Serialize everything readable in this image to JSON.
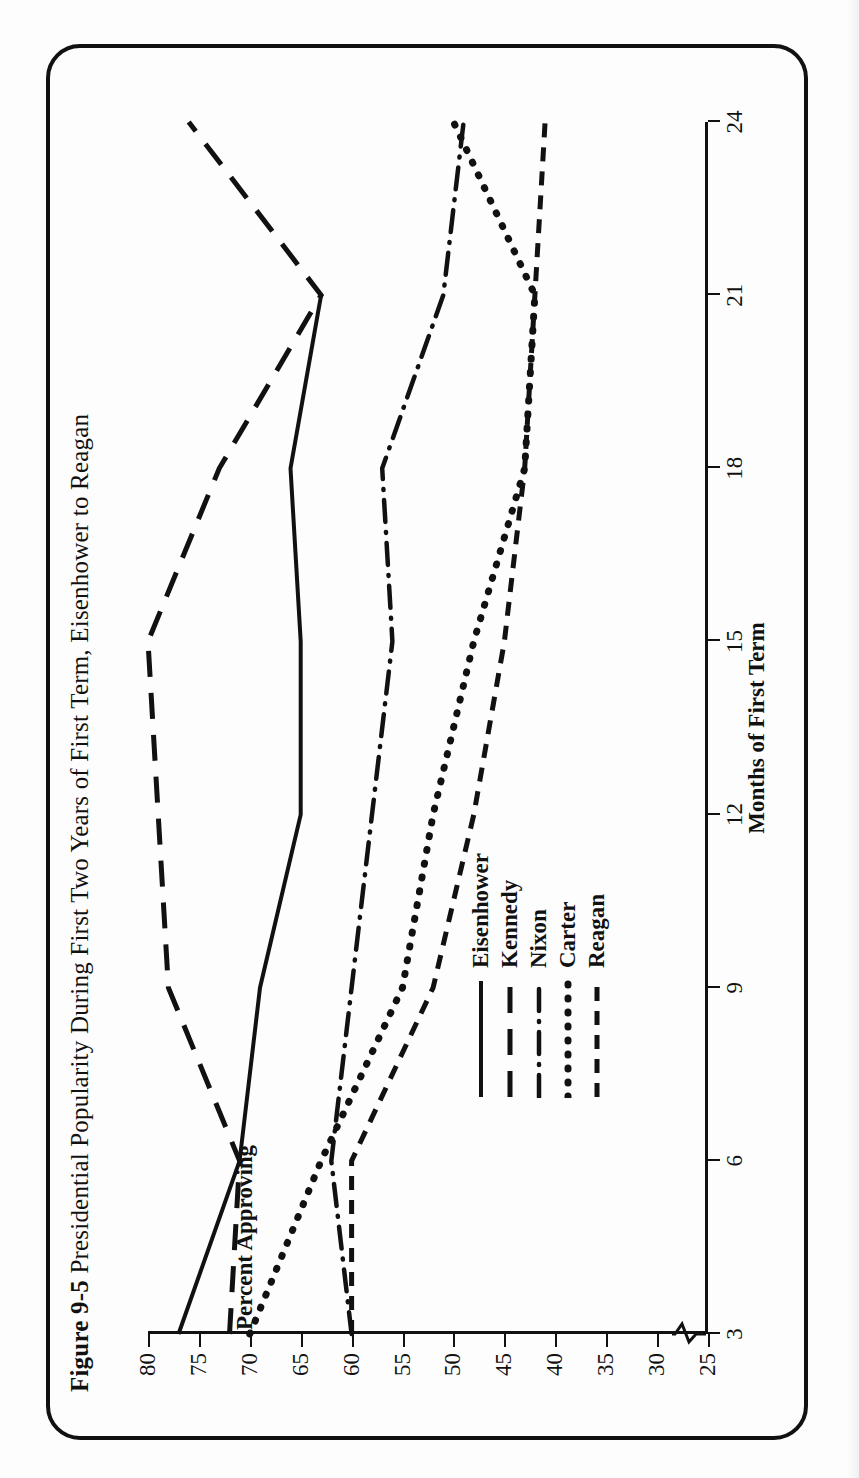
{
  "figure": {
    "number": "Figure 9-5",
    "caption": "Presidential Popularity During First Two Years of First Term, Eisenhower to Reagan",
    "line_color": "#111111",
    "background_color": "#ffffff"
  },
  "chart_data": {
    "type": "line",
    "title": "Figure 9-5 Presidential Popularity During First Two Years of First Term, Eisenhower to Reagan",
    "xlabel": "Months of First Term",
    "ylabel": "Percent Approving",
    "xlim": [
      3,
      24
    ],
    "ylim": [
      25,
      80
    ],
    "xticks": [
      3,
      6,
      9,
      12,
      15,
      18,
      21,
      24
    ],
    "yticks": [
      25,
      30,
      35,
      40,
      45,
      50,
      55,
      60,
      65,
      70,
      75,
      80
    ],
    "grid": false,
    "y_axis_break": true,
    "y_axis_break_note": "zig-zag break below 25",
    "legend_position": "center-left inside axes",
    "series": [
      {
        "name": "Eisenhower",
        "style": "solid",
        "x": [
          3,
          6,
          9,
          12,
          15,
          18,
          21
        ],
        "y": [
          77,
          71,
          69,
          65,
          65,
          66,
          63
        ]
      },
      {
        "name": "Kennedy",
        "style": "long-dash",
        "x": [
          3,
          6,
          9,
          12,
          15,
          18,
          21,
          24
        ],
        "y": [
          72,
          71,
          78,
          79,
          80,
          73,
          63,
          76
        ]
      },
      {
        "name": "Nixon",
        "style": "dash-dot",
        "x": [
          3,
          6,
          9,
          12,
          15,
          18,
          21,
          24
        ],
        "y": [
          60,
          62,
          60,
          58,
          56,
          57,
          51,
          49
        ]
      },
      {
        "name": "Carter",
        "style": "dotted",
        "x": [
          3,
          6,
          9,
          12,
          15,
          18,
          21,
          24
        ],
        "y": [
          70,
          63,
          55,
          52,
          48,
          43,
          42,
          50
        ]
      },
      {
        "name": "Reagan",
        "style": "short-dash",
        "x": [
          3,
          6,
          9,
          12,
          15,
          18,
          21,
          24
        ],
        "y": [
          60,
          60,
          52,
          48,
          45,
          43,
          42,
          41
        ]
      }
    ]
  },
  "legend": {
    "items": [
      {
        "label": "Eisenhower",
        "style": "solid"
      },
      {
        "label": "Kennedy",
        "style": "long-dash"
      },
      {
        "label": "Nixon",
        "style": "dash-dot"
      },
      {
        "label": "Carter",
        "style": "dotted"
      },
      {
        "label": "Reagan",
        "style": "short-dash"
      }
    ]
  }
}
